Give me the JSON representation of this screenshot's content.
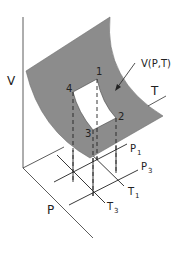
{
  "diagram": {
    "axes": {
      "vertical": "V",
      "depth": "P",
      "horizontal": "T"
    },
    "surface_label": "V(P,T)",
    "corner_labels": [
      "1",
      "2",
      "3",
      "4"
    ],
    "grid_labels": {
      "p1": "P",
      "p1_sub": "1",
      "p3": "P",
      "p3_sub": "3",
      "t1": "T",
      "t1_sub": "1",
      "t3": "T",
      "t3_sub": "3"
    },
    "colors": {
      "surface": "#8c8c8c",
      "line": "#222222",
      "window": "#ffffff"
    }
  }
}
